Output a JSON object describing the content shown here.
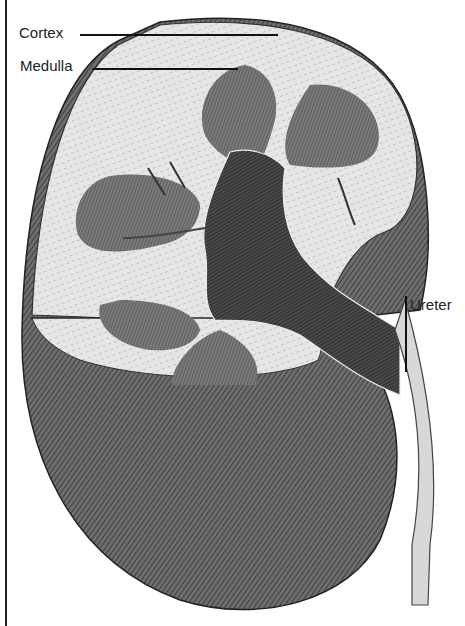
{
  "diagram": {
    "labels": [
      {
        "id": "cortex",
        "text": "Cortex"
      },
      {
        "id": "medulla",
        "text": "Medulla"
      },
      {
        "id": "ureter",
        "text": "Ureter"
      }
    ]
  }
}
